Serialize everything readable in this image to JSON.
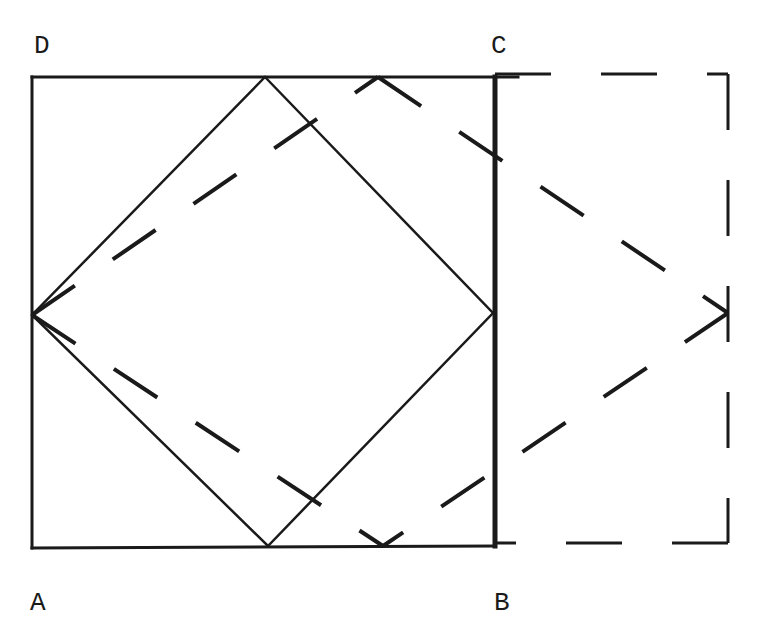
{
  "labels": {
    "A": "A",
    "B": "B",
    "C": "C",
    "D": "D"
  },
  "colors": {
    "ink": "#1a1a1a",
    "background": "#ffffff"
  }
}
